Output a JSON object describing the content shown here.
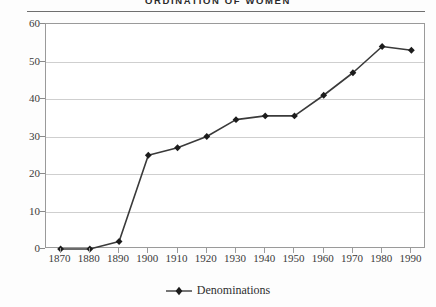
{
  "chart_data": {
    "type": "line",
    "title": "ORDINATION OF WOMEN",
    "xlabel": "",
    "ylabel": "",
    "x": [
      1870,
      1880,
      1890,
      1900,
      1910,
      1920,
      1930,
      1940,
      1950,
      1960,
      1970,
      1980,
      1990
    ],
    "categories": [
      "1870",
      "1880",
      "1890",
      "1900",
      "1910",
      "1920",
      "1930",
      "1940",
      "1950",
      "1960",
      "1970",
      "1980",
      "1990"
    ],
    "series": [
      {
        "name": "Denominations",
        "values": [
          0,
          0,
          2,
          25,
          27,
          30,
          34.5,
          35.5,
          35.5,
          41,
          47,
          54,
          53
        ],
        "color": "#3a3a3a",
        "marker": "diamond"
      }
    ],
    "ylim": [
      0,
      60
    ],
    "yticks": [
      0,
      10,
      20,
      30,
      40,
      50,
      60
    ],
    "ytick_labels": [
      "0",
      "10",
      "20",
      "30",
      "40",
      "50",
      "60"
    ],
    "xlim": [
      1865,
      1995
    ],
    "grid": "horizontal",
    "legend_position": "bottom"
  },
  "legend": {
    "entries": [
      {
        "label": "Denominations",
        "color": "#3a3a3a"
      }
    ]
  },
  "colors": {
    "line": "#3a3a3a",
    "marker": "#1c1c1c",
    "gridline": "#cfcfcf",
    "frame": "#9a9a9a",
    "title_rule": "#6f6f6f",
    "background": "#fdfdfd",
    "text": "#3a3a3a"
  }
}
